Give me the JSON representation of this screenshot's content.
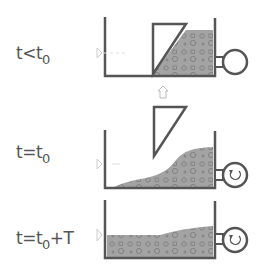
{
  "diagram": {
    "stages": [
      {
        "id": "before",
        "label_main": "t<t",
        "label_sub": "0",
        "label_tail": "",
        "gate": "closed",
        "rotation_icon": false
      },
      {
        "id": "release",
        "label_main": "t=t",
        "label_sub": "0",
        "label_tail": "",
        "gate": "lifting",
        "rotation_icon": true
      },
      {
        "id": "after",
        "label_main": "t=t",
        "label_sub": "0",
        "label_tail": "+T",
        "gate": "removed",
        "rotation_icon": true
      }
    ],
    "colors": {
      "wall": "#555555",
      "sediment": "#9a9a9a",
      "grain": "#777777",
      "arrow": "#c8c8c8",
      "text": "#555555"
    },
    "icons": [
      "gate-lift-arrow-icon",
      "inflow-marker-icon",
      "pump-circle-icon",
      "rotation-icon"
    ]
  }
}
